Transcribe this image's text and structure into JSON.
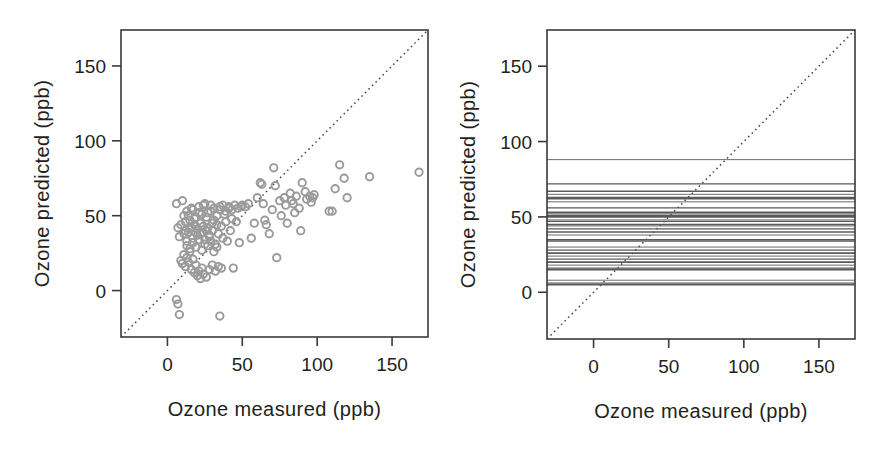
{
  "figure": {
    "width": 894,
    "height": 456,
    "background": "#ffffff",
    "ink_color": "#231f20",
    "point_color": "#9a9a9a",
    "line_color": "#5a5a5a",
    "diagonal_color": "#4a4a4a"
  },
  "panels": {
    "left": {
      "name": "scatter-panel",
      "xlabel": "Ozone measured (ppb)",
      "ylabel": "Ozone predicted (ppb)",
      "xticks": [
        0,
        50,
        100,
        150
      ],
      "yticks": [
        0,
        50,
        100,
        150
      ],
      "xtick_labels": [
        "0",
        "50",
        "100",
        "150"
      ],
      "ytick_labels": [
        "0",
        "50",
        "100",
        "150"
      ],
      "xlim": [
        -31,
        174
      ],
      "ylim": [
        -31,
        174
      ]
    },
    "right": {
      "name": "lines-panel",
      "xlabel": "Ozone measured (ppb)",
      "ylabel": "Ozone predicted (ppb)",
      "xticks": [
        0,
        50,
        100,
        150
      ],
      "yticks": [
        0,
        50,
        100,
        150
      ],
      "xtick_labels": [
        "0",
        "50",
        "100",
        "150"
      ],
      "ytick_labels": [
        "0",
        "50",
        "100",
        "150"
      ],
      "xlim": [
        -31,
        174
      ],
      "ylim": [
        -31,
        174
      ]
    }
  },
  "chart_data": [
    {
      "type": "scatter",
      "panel": "left",
      "title": "",
      "xlabel": "Ozone measured (ppb)",
      "ylabel": "Ozone predicted (ppb)",
      "xlim": [
        -31,
        174
      ],
      "ylim": [
        -31,
        174
      ],
      "xticks": [
        0,
        50,
        100,
        150
      ],
      "yticks": [
        0,
        50,
        100,
        150
      ],
      "grid": false,
      "legend": null,
      "marker": "open-circle",
      "marker_color": "#9a9a9a",
      "annotations": [
        {
          "type": "reference-line",
          "style": "dotted",
          "description": "1:1 identity line",
          "from": [
            -31,
            -31
          ],
          "to": [
            174,
            174
          ]
        }
      ],
      "points": [
        [
          7,
          42
        ],
        [
          8,
          36
        ],
        [
          9,
          44
        ],
        [
          6,
          58
        ],
        [
          10,
          60
        ],
        [
          11,
          38
        ],
        [
          12,
          46
        ],
        [
          13,
          33
        ],
        [
          14,
          50
        ],
        [
          15,
          41
        ],
        [
          16,
          55
        ],
        [
          17,
          35
        ],
        [
          18,
          48
        ],
        [
          19,
          43
        ],
        [
          20,
          37
        ],
        [
          21,
          52
        ],
        [
          22,
          45
        ],
        [
          23,
          39
        ],
        [
          24,
          57
        ],
        [
          25,
          34
        ],
        [
          26,
          49
        ],
        [
          27,
          42
        ],
        [
          28,
          36
        ],
        [
          29,
          53
        ],
        [
          30,
          40
        ],
        [
          31,
          47
        ],
        [
          32,
          31
        ],
        [
          33,
          44
        ],
        [
          34,
          38
        ],
        [
          35,
          56
        ],
        [
          36,
          43
        ],
        [
          37,
          35
        ],
        [
          38,
          51
        ],
        [
          39,
          46
        ],
        [
          40,
          33
        ],
        [
          41,
          55
        ],
        [
          42,
          40
        ],
        [
          43,
          48
        ],
        [
          9,
          20
        ],
        [
          10,
          18
        ],
        [
          11,
          24
        ],
        [
          12,
          16
        ],
        [
          13,
          22
        ],
        [
          14,
          19
        ],
        [
          15,
          26
        ],
        [
          16,
          14
        ],
        [
          17,
          21
        ],
        [
          18,
          12
        ],
        [
          19,
          17
        ],
        [
          20,
          10
        ],
        [
          21,
          13
        ],
        [
          22,
          8
        ],
        [
          23,
          15
        ],
        [
          24,
          11
        ],
        [
          26,
          9
        ],
        [
          28,
          14
        ],
        [
          30,
          17
        ],
        [
          32,
          13
        ],
        [
          34,
          16
        ],
        [
          36,
          15
        ],
        [
          44,
          15
        ],
        [
          6,
          -6
        ],
        [
          7,
          -9
        ],
        [
          8,
          -16
        ],
        [
          35,
          -17
        ],
        [
          12,
          40
        ],
        [
          14,
          39
        ],
        [
          16,
          42
        ],
        [
          18,
          44
        ],
        [
          20,
          41
        ],
        [
          22,
          38
        ],
        [
          24,
          43
        ],
        [
          26,
          40
        ],
        [
          28,
          37
        ],
        [
          30,
          45
        ],
        [
          13,
          30
        ],
        [
          15,
          28
        ],
        [
          17,
          32
        ],
        [
          19,
          29
        ],
        [
          21,
          34
        ],
        [
          23,
          27
        ],
        [
          25,
          31
        ],
        [
          27,
          30
        ],
        [
          29,
          33
        ],
        [
          31,
          26
        ],
        [
          33,
          29
        ],
        [
          11,
          50
        ],
        [
          13,
          53
        ],
        [
          15,
          47
        ],
        [
          17,
          54
        ],
        [
          19,
          49
        ],
        [
          21,
          56
        ],
        [
          23,
          51
        ],
        [
          25,
          58
        ],
        [
          27,
          52
        ],
        [
          29,
          57
        ],
        [
          31,
          55
        ],
        [
          33,
          50
        ],
        [
          35,
          54
        ],
        [
          37,
          57
        ],
        [
          39,
          53
        ],
        [
          41,
          56
        ],
        [
          43,
          54
        ],
        [
          45,
          57
        ],
        [
          47,
          55
        ],
        [
          49,
          56
        ],
        [
          46,
          46
        ],
        [
          48,
          32
        ],
        [
          50,
          57
        ],
        [
          52,
          56
        ],
        [
          54,
          58
        ],
        [
          56,
          35
        ],
        [
          58,
          45
        ],
        [
          60,
          62
        ],
        [
          62,
          72
        ],
        [
          63,
          71
        ],
        [
          64,
          58
        ],
        [
          65,
          47
        ],
        [
          66,
          44
        ],
        [
          68,
          38
        ],
        [
          70,
          54
        ],
        [
          71,
          82
        ],
        [
          72,
          70
        ],
        [
          73,
          22
        ],
        [
          75,
          60
        ],
        [
          76,
          50
        ],
        [
          78,
          62
        ],
        [
          79,
          57
        ],
        [
          80,
          45
        ],
        [
          82,
          65
        ],
        [
          83,
          60
        ],
        [
          84,
          58
        ],
        [
          85,
          52
        ],
        [
          86,
          63
        ],
        [
          88,
          55
        ],
        [
          89,
          40
        ],
        [
          90,
          72
        ],
        [
          92,
          66
        ],
        [
          93,
          61
        ],
        [
          95,
          63
        ],
        [
          96,
          59
        ],
        [
          97,
          62
        ],
        [
          98,
          64
        ],
        [
          108,
          53
        ],
        [
          110,
          53
        ],
        [
          112,
          68
        ],
        [
          115,
          84
        ],
        [
          118,
          75
        ],
        [
          120,
          62
        ],
        [
          135,
          76
        ],
        [
          168,
          79
        ]
      ]
    },
    {
      "type": "line",
      "panel": "right",
      "title": "",
      "xlabel": "Ozone measured (ppb)",
      "ylabel": "Ozone predicted (ppb)",
      "xlim": [
        -31,
        174
      ],
      "ylim": [
        -31,
        174
      ],
      "xticks": [
        0,
        50,
        100,
        150
      ],
      "yticks": [
        0,
        50,
        100,
        150
      ],
      "grid": false,
      "legend": null,
      "description": "Set of horizontal constant-prediction lines spanning the full x range",
      "annotations": [
        {
          "type": "reference-line",
          "style": "dotted",
          "description": "1:1 identity line",
          "from": [
            -31,
            -31
          ],
          "to": [
            174,
            174
          ]
        }
      ],
      "horizontal_line_y_values": [
        88,
        72,
        67,
        65,
        63,
        62,
        60,
        56,
        53,
        52,
        51,
        50,
        48,
        47,
        45,
        44,
        42,
        40,
        38,
        35,
        34,
        30,
        28,
        26,
        24,
        22,
        20,
        18,
        16,
        15,
        8,
        6,
        5
      ]
    }
  ]
}
